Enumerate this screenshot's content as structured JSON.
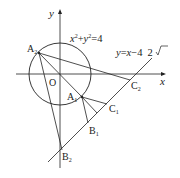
{
  "diagram": {
    "axes": {
      "x_label": "x",
      "y_label": "y",
      "origin_label": "O"
    },
    "circle": {
      "equation": "x²+y²=4",
      "eq_lhs_x": "x",
      "eq_sup1": "2",
      "eq_plus": "+",
      "eq_lhs_y": "y",
      "eq_sup2": "2",
      "eq_rhs": "=4"
    },
    "line": {
      "equation": "y=x−4√2",
      "eq_part1": "y",
      "eq_part2": "=",
      "eq_part3": "x",
      "eq_part4": "−4",
      "eq_sqrt_arg": "2"
    },
    "points": {
      "A1": {
        "base": "A",
        "sub": "1"
      },
      "A2": {
        "base": "A",
        "sub": "2"
      },
      "B1": {
        "base": "B",
        "sub": "1"
      },
      "B2": {
        "base": "B",
        "sub": "2"
      },
      "C1": {
        "base": "C",
        "sub": "1"
      },
      "C2": {
        "base": "C",
        "sub": "2"
      }
    },
    "colors": {
      "stroke": "#222222",
      "background": "#ffffff"
    }
  }
}
